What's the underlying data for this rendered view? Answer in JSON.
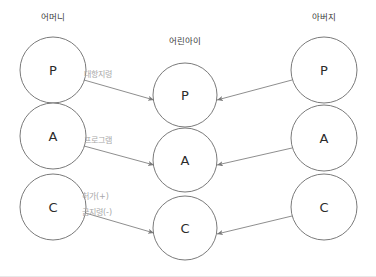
{
  "diagram": {
    "title_mother": "어머니",
    "title_child": "어린아이",
    "title_father": "아버지",
    "colors": {
      "background": "#ffffff",
      "circle_stroke": "#6b6b6b",
      "circle_fill": "#ffffff",
      "arrow_stroke": "#7a7a7a",
      "node_text": "#2b2b2b",
      "title_text": "#3a3a3a",
      "edge_label_text": "#a8a8a8",
      "bottom_border": "#e8e8e8"
    },
    "columns": [
      {
        "key": "mother",
        "title": "어머니",
        "title_x": 53,
        "title_y": 20,
        "cx": 53,
        "nodes": [
          {
            "label": "P",
            "cy": 70,
            "r": 33
          },
          {
            "label": "A",
            "cy": 136,
            "r": 33
          },
          {
            "label": "C",
            "cy": 207,
            "r": 33
          }
        ]
      },
      {
        "key": "child",
        "title": "어린아이",
        "title_x": 185,
        "title_y": 44,
        "cx": 185,
        "nodes": [
          {
            "label": "P",
            "cy": 95,
            "r": 32
          },
          {
            "label": "A",
            "cy": 160,
            "r": 32
          },
          {
            "label": "C",
            "cy": 228,
            "r": 32
          }
        ]
      },
      {
        "key": "father",
        "title": "아버지",
        "title_x": 324,
        "title_y": 20,
        "cx": 324,
        "nodes": [
          {
            "label": "P",
            "cy": 70,
            "r": 33
          },
          {
            "label": "A",
            "cy": 138,
            "r": 33
          },
          {
            "label": "C",
            "cy": 207,
            "r": 33
          }
        ]
      }
    ],
    "arrows": [
      {
        "key": "mother-p-to-child-p",
        "from": "mother.P",
        "to": "child.P",
        "x1": 84,
        "y1": 80,
        "x2": 154,
        "y2": 100,
        "direction": "right"
      },
      {
        "key": "mother-a-to-child-a",
        "from": "mother.A",
        "to": "child.A",
        "x1": 84,
        "y1": 146,
        "x2": 154,
        "y2": 165,
        "direction": "right"
      },
      {
        "key": "mother-c-to-child-c",
        "from": "mother.C",
        "to": "child.C",
        "x1": 82,
        "y1": 212,
        "x2": 154,
        "y2": 233,
        "direction": "right"
      },
      {
        "key": "father-p-to-child-p",
        "from": "father.P",
        "to": "child.P",
        "x1": 292,
        "y1": 80,
        "x2": 217,
        "y2": 100,
        "direction": "left"
      },
      {
        "key": "father-a-to-child-a",
        "from": "father.A",
        "to": "child.A",
        "x1": 292,
        "y1": 148,
        "x2": 217,
        "y2": 165,
        "direction": "left"
      },
      {
        "key": "father-c-to-child-c",
        "from": "father.C",
        "to": "child.C",
        "x1": 292,
        "y1": 216,
        "x2": 217,
        "y2": 234,
        "direction": "left"
      }
    ],
    "edge_labels": [
      {
        "key": "counter-injunction",
        "text": "대항지령",
        "x": 84,
        "y": 77
      },
      {
        "key": "program",
        "text": "프로그램",
        "x": 84,
        "y": 143
      },
      {
        "key": "permission",
        "text": "허가(+)",
        "x": 82,
        "y": 199
      },
      {
        "key": "injunction",
        "text": "금지령(-)",
        "x": 82,
        "y": 215
      }
    ]
  }
}
